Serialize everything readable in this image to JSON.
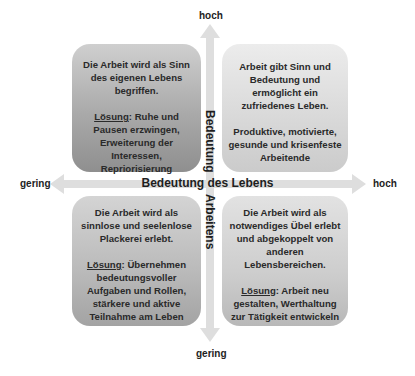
{
  "axes": {
    "horizontal": {
      "label": "Bedeutung des Lebens",
      "low": "gering",
      "high": "hoch"
    },
    "vertical": {
      "label_part1": "Bedeutung",
      "label_part2": "Arbeitens",
      "low": "gering",
      "high": "hoch"
    }
  },
  "quadrants": {
    "top_left": {
      "description": "Die Arbeit wird als Sinn des eigenen Lebens begriffen.",
      "solution_label": "Lösung",
      "solution_text": ": Ruhe und Pausen erzwingen, Erweiterung der Interessen, Repriorisierung"
    },
    "top_right": {
      "description": "Arbeit gibt Sinn und Bedeutung und ermöglicht ein zufriedenes Leben.",
      "outcome": "Produktive, motivierte, gesunde und krisenfeste Arbeitende"
    },
    "bottom_left": {
      "description": "Die Arbeit wird als sinnlose und seelenlose Plackerei erlebt.",
      "solution_label": "Lösung",
      "solution_text": ": Übernehmen bedeutungsvoller Aufgaben und Rollen, stärkere und aktive Teilnahme am Leben"
    },
    "bottom_right": {
      "description": "Die Arbeit wird als notwendiges Übel erlebt und abgekoppelt von anderen Lebensbereichen.",
      "solution_label": "Lösung",
      "solution_text": ": Arbeit neu gestalten, Werthaltung zur Tätigkeit entwickeln"
    }
  },
  "colors": {
    "arrow": "#dedede",
    "text": "#222222"
  }
}
